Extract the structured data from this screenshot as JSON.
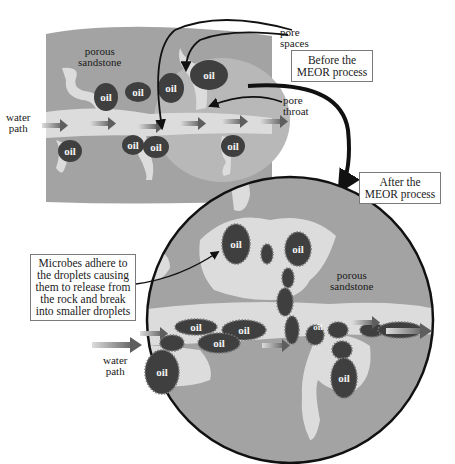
{
  "diagram": {
    "before_panel": {
      "caption": "Before the MEOR process",
      "caption_lines": [
        "Before the",
        "MEOR process"
      ],
      "labels": {
        "porous_sandstone": [
          "porous",
          "sandstone"
        ],
        "water_path": [
          "water",
          "path"
        ],
        "pore_spaces": [
          "pore",
          "spaces"
        ],
        "pore_throat": [
          "pore",
          "throat"
        ]
      },
      "oil_droplets": [
        "oil",
        "oil",
        "oil",
        "oil",
        "oil",
        "oil",
        "oil",
        "oil",
        "oil"
      ]
    },
    "after_panel": {
      "caption": "After the MEOR process",
      "caption_lines": [
        "After the",
        "MEOR process"
      ],
      "labels": {
        "porous_sandstone": [
          "porous",
          "sandstone"
        ],
        "water_path": [
          "water",
          "path"
        ]
      },
      "callout_lines": [
        "Microbes adhere to",
        "the droplets causing",
        "them to release from",
        "the rock and break",
        "into smaller droplets"
      ],
      "oil_droplets": [
        "oil",
        "oil",
        "oil",
        "oil",
        "oil",
        "oil",
        "oil"
      ]
    },
    "colors": {
      "rock": "#a3a3a3",
      "rock_light": "#b8b8b8",
      "pore": "#dcdcdc",
      "oil": "#4a4a4a",
      "arrow": "#6e6e6e",
      "outline": "#111111"
    }
  }
}
